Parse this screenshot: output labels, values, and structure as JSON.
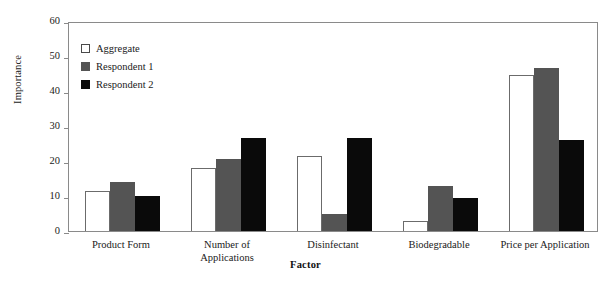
{
  "chart_data": {
    "type": "bar",
    "title": "",
    "xlabel": "Factor",
    "ylabel": "Importance",
    "ylim": [
      0,
      60
    ],
    "yticks": [
      0,
      10,
      20,
      30,
      40,
      50,
      60
    ],
    "grid": false,
    "legend_position": "upper-left-inside",
    "categories": [
      "Product Form",
      "Number of\nApplications",
      "Disinfectant",
      "Biodegradable",
      "Price per Application"
    ],
    "series": [
      {
        "name": "Aggregate",
        "color": "#ffffff",
        "values": [
          11.3,
          18.0,
          21.5,
          3.0,
          44.5
        ]
      },
      {
        "name": "Respondent 1",
        "color": "#545454",
        "values": [
          14.0,
          20.5,
          5.0,
          13.0,
          46.5
        ]
      },
      {
        "name": "Respondent 2",
        "color": "#0a0a0a",
        "values": [
          10.0,
          26.5,
          26.5,
          9.5,
          26.0
        ]
      }
    ]
  },
  "axes": {
    "y_title": "Importance",
    "x_title": "Factor",
    "y_tick_labels": [
      "0",
      "10",
      "20",
      "30",
      "40",
      "50",
      "60"
    ]
  },
  "legend": {
    "items": [
      {
        "label": "Aggregate",
        "swatch": "hollow-square-swatch"
      },
      {
        "label": "Respondent 1",
        "swatch": "gray-square-swatch"
      },
      {
        "label": "Respondent 2",
        "swatch": "black-square-swatch"
      }
    ]
  }
}
